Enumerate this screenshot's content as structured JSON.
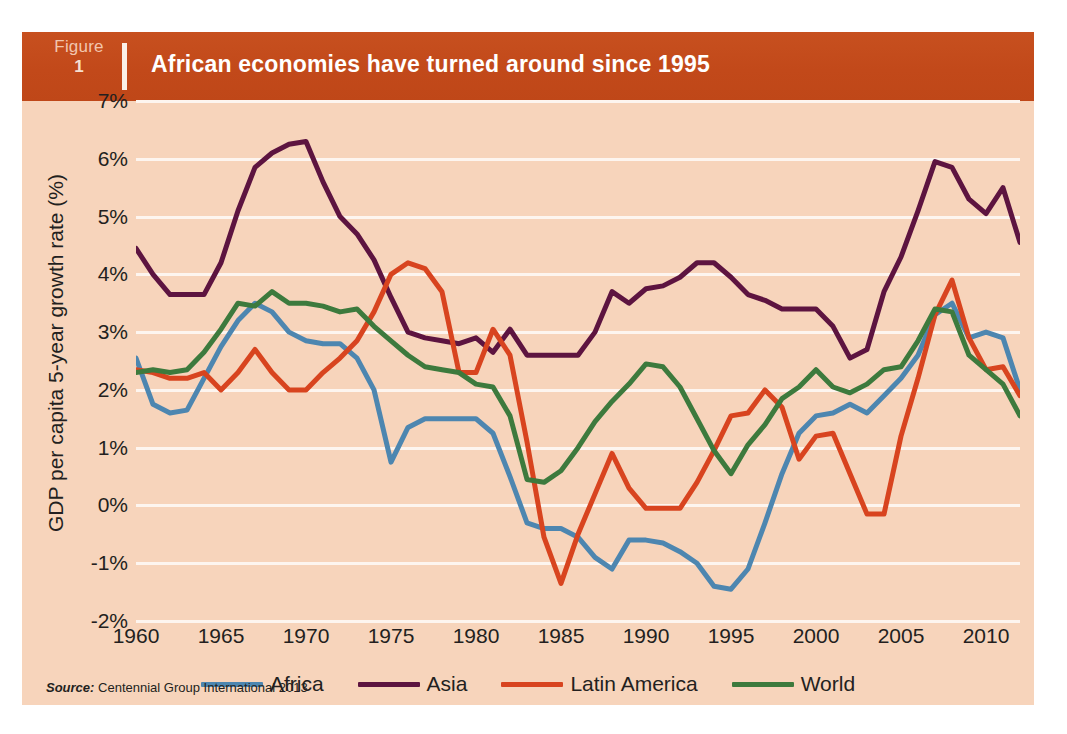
{
  "banner": {
    "figure_label": "Figure",
    "figure_number": "1",
    "title": "African economies have turned around since 1995",
    "banner_color": "#c2491a"
  },
  "card": {
    "background_color": "#f7d4bb"
  },
  "source": {
    "prefix": "Source:",
    "text": "Centennial Group International 2013"
  },
  "legend": {
    "items": [
      {
        "label": "Africa",
        "color": "#4d86b0"
      },
      {
        "label": "Asia",
        "color": "#5d1440"
      },
      {
        "label": "Latin America",
        "color": "#d8441f"
      },
      {
        "label": "World",
        "color": "#3d7a3d"
      }
    ]
  },
  "axes": {
    "ylabel": "GDP per capita 5-year growth rate (%)",
    "yticks": [
      "7%",
      "6%",
      "5%",
      "4%",
      "3%",
      "2%",
      "1%",
      "0%",
      "-1%",
      "-2%"
    ],
    "xticks": [
      "1960",
      "1965",
      "1970",
      "1975",
      "1980",
      "1985",
      "1990",
      "1995",
      "2000",
      "2005",
      "2010"
    ],
    "gridline_color": "#fdf5ef"
  },
  "chart_data": {
    "type": "line",
    "title": "African economies have turned around since 1995",
    "xlabel": "",
    "ylabel": "GDP per capita 5-year growth rate (%)",
    "xlim": [
      1960,
      2012
    ],
    "ylim": [
      -2,
      7
    ],
    "ytick_values": [
      7,
      6,
      5,
      4,
      3,
      2,
      1,
      0,
      -1,
      -2
    ],
    "xtick_values": [
      1960,
      1965,
      1970,
      1975,
      1980,
      1985,
      1990,
      1995,
      2000,
      2005,
      2010
    ],
    "grid": true,
    "legend_position": "bottom",
    "x": [
      1960,
      1961,
      1962,
      1963,
      1964,
      1965,
      1966,
      1967,
      1968,
      1969,
      1970,
      1971,
      1972,
      1973,
      1974,
      1975,
      1976,
      1977,
      1978,
      1979,
      1980,
      1981,
      1982,
      1983,
      1984,
      1985,
      1986,
      1987,
      1988,
      1989,
      1990,
      1991,
      1992,
      1993,
      1994,
      1995,
      1996,
      1997,
      1998,
      1999,
      2000,
      2001,
      2002,
      2003,
      2004,
      2005,
      2006,
      2007,
      2008,
      2009,
      2010,
      2011,
      2012
    ],
    "series": [
      {
        "name": "Africa",
        "color": "#4d86b0",
        "values": [
          2.55,
          1.75,
          1.6,
          1.65,
          2.2,
          2.75,
          3.2,
          3.5,
          3.35,
          3.0,
          2.85,
          2.8,
          2.8,
          2.55,
          2.0,
          0.75,
          1.35,
          1.5,
          1.5,
          1.5,
          1.5,
          1.25,
          0.5,
          -0.3,
          -0.4,
          -0.4,
          -0.55,
          -0.9,
          -1.1,
          -0.6,
          -0.6,
          -0.65,
          -0.8,
          -1.0,
          -1.4,
          -1.45,
          -1.1,
          -0.3,
          0.55,
          1.25,
          1.55,
          1.6,
          1.75,
          1.6,
          1.9,
          2.2,
          2.6,
          3.3,
          3.5,
          2.9,
          3.0,
          2.9,
          2.0
        ]
      },
      {
        "name": "Asia",
        "color": "#5d1440",
        "values": [
          4.45,
          4.0,
          3.65,
          3.65,
          3.65,
          4.2,
          5.1,
          5.85,
          6.1,
          6.25,
          6.3,
          5.6,
          5.0,
          4.7,
          4.25,
          3.6,
          3.0,
          2.9,
          2.85,
          2.8,
          2.9,
          2.65,
          3.05,
          2.6,
          2.6,
          2.6,
          2.6,
          3.0,
          3.7,
          3.5,
          3.75,
          3.8,
          3.95,
          4.2,
          4.2,
          3.95,
          3.65,
          3.55,
          3.4,
          3.4,
          3.4,
          3.1,
          2.55,
          2.7,
          3.7,
          4.3,
          5.1,
          5.95,
          5.85,
          5.3,
          5.05,
          5.5,
          4.55
        ]
      },
      {
        "name": "Latin America",
        "color": "#d8441f",
        "values": [
          2.35,
          2.3,
          2.2,
          2.2,
          2.3,
          2.0,
          2.3,
          2.7,
          2.3,
          2.0,
          2.0,
          2.3,
          2.55,
          2.85,
          3.35,
          4.0,
          4.2,
          4.1,
          3.7,
          2.3,
          2.3,
          3.05,
          2.6,
          1.1,
          -0.55,
          -1.35,
          -0.5,
          0.2,
          0.9,
          0.3,
          -0.05,
          -0.05,
          -0.05,
          0.4,
          0.95,
          1.55,
          1.6,
          2.0,
          1.7,
          0.8,
          1.2,
          1.25,
          0.55,
          -0.15,
          -0.15,
          1.2,
          2.2,
          3.3,
          3.9,
          2.9,
          2.35,
          2.4,
          1.9
        ]
      },
      {
        "name": "World",
        "color": "#3d7a3d",
        "values": [
          2.3,
          2.35,
          2.3,
          2.35,
          2.65,
          3.05,
          3.5,
          3.45,
          3.7,
          3.5,
          3.5,
          3.45,
          3.35,
          3.4,
          3.1,
          2.85,
          2.6,
          2.4,
          2.35,
          2.3,
          2.1,
          2.05,
          1.55,
          0.45,
          0.4,
          0.6,
          1.0,
          1.45,
          1.8,
          2.1,
          2.45,
          2.4,
          2.05,
          1.5,
          0.95,
          0.55,
          1.05,
          1.4,
          1.85,
          2.05,
          2.35,
          2.05,
          1.95,
          2.1,
          2.35,
          2.4,
          2.85,
          3.4,
          3.35,
          2.6,
          2.35,
          2.1,
          1.55
        ]
      }
    ]
  }
}
